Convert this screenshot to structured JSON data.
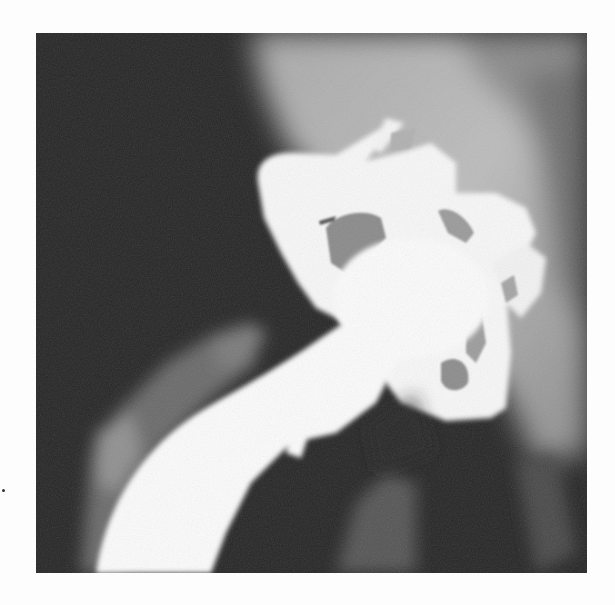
{
  "figure": {
    "kind": "x-ray",
    "colors": {
      "background_page": "#fdfdfd",
      "soft_tissue_dark": "#2a2a2a",
      "bone_mid_gray": "#9a9a9a",
      "pelvis_light_gray": "#b8b8b8",
      "metal_implant": "#fbfbfb",
      "implant_cavity_gray": "#8e8e8e"
    },
    "regions": [
      {
        "name": "femoral-stem",
        "description": "curved bright white stem descending to lower-left"
      },
      {
        "name": "acetabular-cup",
        "description": "bright white flanged cup with perforations"
      },
      {
        "name": "pelvis",
        "description": "mid-gray bone region upper-right"
      },
      {
        "name": "femur",
        "description": "faint gray femoral cortex lower-left"
      }
    ]
  }
}
